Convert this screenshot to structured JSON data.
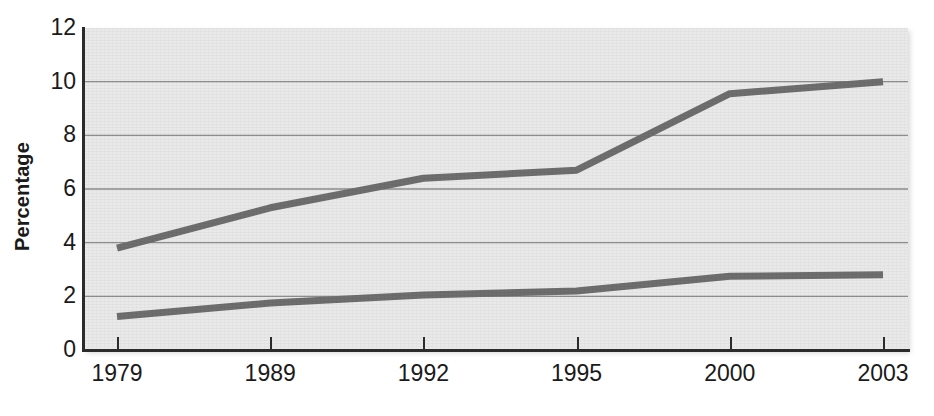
{
  "chart_data": {
    "type": "line",
    "title": "",
    "xlabel": "",
    "ylabel": "Percentage",
    "categories": [
      "1979",
      "1989",
      "1992",
      "1995",
      "2000",
      "2003"
    ],
    "series": [
      {
        "name": "upper-series",
        "values": [
          3.8,
          5.3,
          6.4,
          6.7,
          9.55,
          10.0
        ],
        "color": "#6e6e6e"
      },
      {
        "name": "lower-series",
        "values": [
          1.25,
          1.75,
          2.05,
          2.2,
          2.75,
          2.8
        ],
        "color": "#6e6e6e"
      }
    ],
    "ylim": [
      0,
      12
    ],
    "yticks": [
      "0",
      "2",
      "4",
      "6",
      "8",
      "10",
      "12"
    ],
    "ytick_values": [
      0,
      2,
      4,
      6,
      8,
      10,
      12
    ],
    "grid": true,
    "grid_axis": "y",
    "legend": "none",
    "plot_background": "#e9e9e9",
    "grid_color": "#8d8d8d",
    "axis_color": "#2b2b2b",
    "line_width_px": 7
  }
}
